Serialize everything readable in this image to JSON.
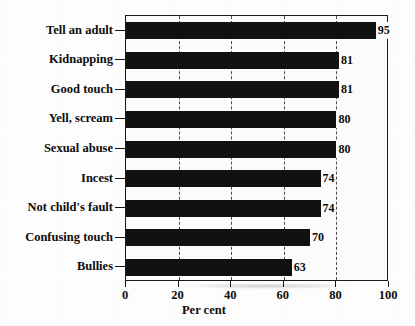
{
  "chart_data": {
    "type": "bar",
    "orientation": "horizontal",
    "title": "",
    "xlabel": "Per cent",
    "ylabel": "",
    "xlim": [
      0,
      100
    ],
    "xticks": [
      0,
      20,
      40,
      60,
      80,
      100
    ],
    "xtick_labels": [
      "0",
      "20",
      "40",
      "60",
      "80",
      "100"
    ],
    "grid": "vertical-dashed",
    "legend": "none",
    "bar_color": "#111111",
    "categories": [
      "Tell an adult",
      "Kidnapping",
      "Good touch",
      "Yell, scream",
      "Sexual abuse",
      "Incest",
      "Not child's fault",
      "Confusing touch",
      "Bullies"
    ],
    "values": [
      95,
      81,
      81,
      80,
      80,
      74,
      74,
      70,
      63
    ],
    "value_labels": [
      "95",
      "81",
      "81",
      "80",
      "80",
      "74",
      "74",
      "70",
      "63"
    ]
  }
}
